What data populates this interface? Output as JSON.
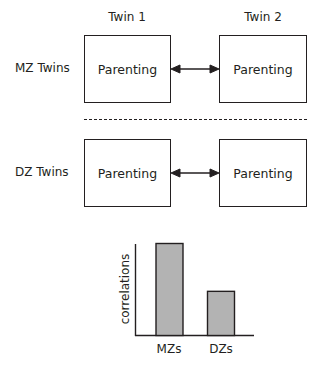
{
  "columns": {
    "twin1": "Twin 1",
    "twin2": "Twin 2"
  },
  "rows": [
    {
      "label": "MZ Twins",
      "box1": "Parenting",
      "box2": "Parenting"
    },
    {
      "label": "DZ Twins",
      "box1": "Parenting",
      "box2": "Parenting"
    }
  ],
  "chart_data": {
    "type": "bar",
    "categories": [
      "MZs",
      "DZs"
    ],
    "values": [
      1.0,
      0.48
    ],
    "title": "",
    "xlabel": "",
    "ylabel": "correlations",
    "ylim": [
      0,
      1
    ],
    "bar_color": "#b3b3b3",
    "grid": false,
    "legend": null
  }
}
